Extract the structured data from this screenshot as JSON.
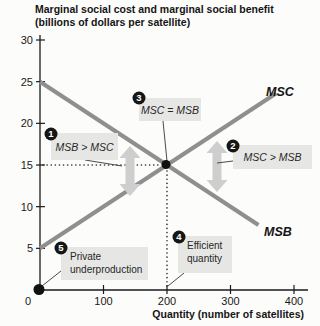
{
  "header": {
    "title_line1": "Marginal social cost and marginal social benefit",
    "title_line2": "(billions of dollars per satellite)"
  },
  "chart_data": {
    "type": "line",
    "title": "Marginal social cost and marginal social benefit (billions of dollars per satellite)",
    "xlabel": "Quantity (number of satellites)",
    "ylabel": "",
    "xlim": [
      0,
      420
    ],
    "ylim": [
      0,
      30.5
    ],
    "x_ticks": [
      0,
      100,
      200,
      300,
      400
    ],
    "y_ticks": [
      5,
      10,
      15,
      20,
      25,
      30
    ],
    "grid": false,
    "series": [
      {
        "name": "MSC",
        "x": [
          0,
          372
        ],
        "values": [
          5,
          23.6
        ],
        "label_px": {
          "x": 266,
          "y": 96
        }
      },
      {
        "name": "MSB",
        "x": [
          0,
          344
        ],
        "values": [
          25,
          7.8
        ],
        "label_px": {
          "x": 264,
          "y": 236
        }
      }
    ],
    "equilibrium": {
      "x": 200,
      "y": 15
    },
    "points": [
      {
        "name": "private-production-point",
        "x": 0,
        "y": 0,
        "r": 5.5
      },
      {
        "name": "efficient-point",
        "x": 200,
        "y": 15,
        "r": 4.5
      }
    ],
    "gap_arrows": [
      {
        "name": "msb-exceeds-msc-gap-arrow",
        "cx": 130,
        "y1": 146,
        "y2": 196
      },
      {
        "name": "msc-exceeds-msb-gap-arrow",
        "cx": 217,
        "y1": 141,
        "y2": 192
      }
    ],
    "annotations": [
      {
        "num": "1",
        "lines": [
          "MSB > MSC"
        ],
        "italic": true,
        "box": {
          "x": 51,
          "y": 133,
          "w": 67,
          "h": 27
        },
        "badge": {
          "x": 51,
          "y": 134
        },
        "leader": {
          "x1": 85,
          "y1": 160,
          "x2": 122,
          "y2": 166
        }
      },
      {
        "num": "2",
        "lines": [
          "MSC > MSB"
        ],
        "italic": true,
        "box": {
          "x": 233,
          "y": 145,
          "w": 79,
          "h": 24
        },
        "badge": {
          "x": 233,
          "y": 146
        },
        "leader": {
          "x1": 233,
          "y1": 161,
          "x2": 217,
          "y2": 163
        }
      },
      {
        "num": "3",
        "lines": [
          "MSC = MSB"
        ],
        "italic": true,
        "box": {
          "x": 139,
          "y": 98,
          "w": 62,
          "h": 23
        },
        "badge": {
          "x": 139,
          "y": 98
        },
        "leader": {
          "x1": 163,
          "y1": 121,
          "x2": 167,
          "y2": 161
        }
      },
      {
        "num": "4",
        "lines": [
          "Efficient",
          "quantity"
        ],
        "italic": false,
        "box": {
          "x": 178,
          "y": 236,
          "w": 54,
          "h": 37
        },
        "badge": {
          "x": 179,
          "y": 237
        },
        "leader": {
          "x1": 184,
          "y1": 273,
          "x2": 168,
          "y2": 286
        }
      },
      {
        "num": "5",
        "lines": [
          "Private",
          "underproduction"
        ],
        "italic": false,
        "box": {
          "x": 61,
          "y": 247,
          "w": 87,
          "h": 33
        },
        "badge": {
          "x": 61,
          "y": 248
        },
        "leader": {
          "x1": 61,
          "y1": 271,
          "x2": 42,
          "y2": 286
        }
      }
    ],
    "colors": {
      "curve": "#8f8f8f",
      "arrow": "#cecece",
      "box_fill": "#e6e6e5",
      "badge": "#161616",
      "badge_text": "#ffffff",
      "axis": "#1a1a1a",
      "leader": "#4a4a4a",
      "dotted": "#2e2e2e"
    }
  }
}
